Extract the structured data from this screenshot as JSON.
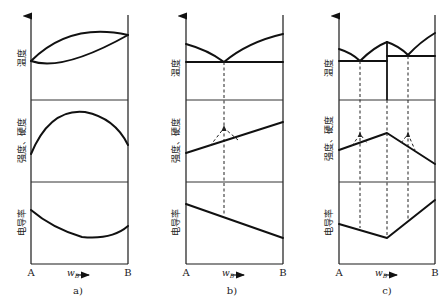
{
  "figure": {
    "type": "property-composition diagrams for binary alloy systems",
    "panels": [
      {
        "id": "a",
        "caption": "a)",
        "description": "Continuous solid solution",
        "rows": [
          {
            "label": "温度",
            "meaning": "temperature",
            "curves": "liquidus/solidus lens between A and B"
          },
          {
            "label": "强度、硬度",
            "meaning": "strength, hardness",
            "curves": "convex maximum"
          },
          {
            "label": "电导率",
            "meaning": "electrical conductivity",
            "curves": "concave minimum"
          }
        ],
        "x_left": "A",
        "x_right": "B",
        "x_axis_label": "w",
        "x_axis_subscript": "B",
        "x_axis_arrow": "→"
      },
      {
        "id": "b",
        "caption": "b)",
        "description": "Simple eutectic (mechanical mixture)",
        "rows": [
          {
            "label": "温度",
            "meaning": "temperature",
            "curves": "V-shaped liquidus with eutectic horizontal"
          },
          {
            "label": "强度、硬度",
            "meaning": "strength, hardness",
            "curves": "linear, with dashed peak at eutectic"
          },
          {
            "label": "电导率",
            "meaning": "electrical conductivity",
            "curves": "linear decrease"
          }
        ],
        "x_left": "A",
        "x_right": "B",
        "x_axis_label": "w",
        "x_axis_subscript": "B",
        "x_axis_arrow": "→"
      },
      {
        "id": "c",
        "caption": "c)",
        "description": "Eutectics with intermediate compound",
        "rows": [
          {
            "label": "温度",
            "meaning": "temperature",
            "curves": "two eutectics with congruent compound maximum"
          },
          {
            "label": "强度、硬度",
            "meaning": "strength, hardness",
            "curves": "peak at compound, dashed peaks at eutectics"
          },
          {
            "label": "电导率",
            "meaning": "electrical conductivity",
            "curves": "V-shaped minimum at compound"
          }
        ],
        "x_left": "A",
        "x_right": "B",
        "x_axis_label": "w",
        "x_axis_subscript": "B",
        "x_axis_arrow": "→"
      }
    ]
  },
  "labels": {
    "temp": "温度",
    "strength": "强度、硬度",
    "conductivity": "电导率",
    "A": "A",
    "B": "B",
    "w": "w",
    "wsub": "B",
    "cap_a": "a)",
    "cap_b": "b)",
    "cap_c": "c)"
  }
}
